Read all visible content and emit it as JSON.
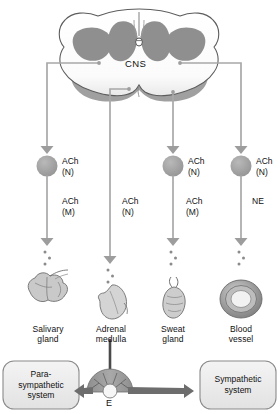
{
  "diagram": {
    "title_cns": "CNS",
    "epinephrine_label": "E"
  },
  "pathways": [
    {
      "id": "salivary",
      "ganglionic_transmitter": "ACh",
      "ganglionic_receptor": "(N)",
      "effector_transmitter": "ACh",
      "effector_receptor": "(M)",
      "organ_line1": "Salivary",
      "organ_line2": "gland",
      "has_ganglion": true
    },
    {
      "id": "adrenal",
      "ganglionic_transmitter": "",
      "ganglionic_receptor": "",
      "effector_transmitter": "ACh",
      "effector_receptor": "(N)",
      "organ_line1": "Adrenal",
      "organ_line2": "medulla",
      "has_ganglion": false
    },
    {
      "id": "sweat",
      "ganglionic_transmitter": "ACh",
      "ganglionic_receptor": "(N)",
      "effector_transmitter": "ACh",
      "effector_receptor": "(M)",
      "organ_line1": "Sweat",
      "organ_line2": "gland",
      "has_ganglion": true
    },
    {
      "id": "vessel",
      "ganglionic_transmitter": "ACh",
      "ganglionic_receptor": "(N)",
      "effector_transmitter": "NE",
      "effector_receptor": "",
      "organ_line1": "Blood",
      "organ_line2": "vessel",
      "has_ganglion": true
    }
  ],
  "summary": {
    "left_line1": "Para-",
    "left_line2": "sympathetic",
    "left_line3": "system",
    "right_line1": "Sympathetic",
    "right_line2": "system"
  },
  "colors": {
    "line": "#a8a8a8",
    "ganglion_fill": "#9d9d9d",
    "gray_matter": "#8f8f8f",
    "cord_outline": "#5a5a5a",
    "box_fill": "#ededed",
    "box_stroke": "#8a8a8a",
    "arrow": "#6d6d6d",
    "dark_line": "#4a4a4a"
  }
}
